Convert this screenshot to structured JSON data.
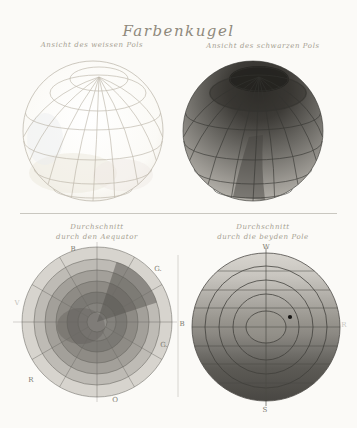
{
  "plate": {
    "title": "Farbenkugel",
    "background_color": "#fbfaf7",
    "ink_color": "#343330",
    "caption_color": "#a49d90"
  },
  "figures": {
    "white_pole": {
      "caption": "Ansicht des weissen Pols",
      "description": "wireframe sphere seen from the white pole, nearly white shading"
    },
    "black_pole": {
      "caption": "Ansicht des schwarzen Pols",
      "description": "sphere seen from the black pole, dark cap grading lighter toward equator",
      "cap_color": "#23221f",
      "rim_color": "#cfccc5"
    },
    "equator_section": {
      "caption_line1": "Durchschnitt",
      "caption_line2": "durch den Aequator",
      "labels": {
        "top": "B",
        "upper_right": "G.",
        "lower_right": "G.",
        "bottom": "O",
        "lower_left": "R",
        "left": "V"
      },
      "ring_colors_outer_to_inner": [
        "#d7d4ce",
        "#bebbb5",
        "#a3a09a",
        "#8e8b85",
        "#7b7974",
        "#84827d",
        "#918f8a"
      ],
      "sectors": 12
    },
    "polar_section": {
      "caption_line1": "Durchschnitt",
      "caption_line2": "durch die beyden Pole",
      "labels": {
        "top": "W",
        "bottom": "S",
        "left": "B",
        "right": "R"
      },
      "top_color": "#d8d5cf",
      "bottom_color": "#494743"
    }
  }
}
